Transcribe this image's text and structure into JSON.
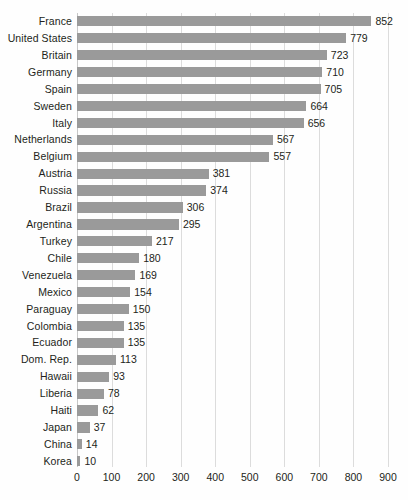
{
  "chart_data": {
    "type": "bar",
    "orientation": "horizontal",
    "title": "",
    "subtitle": "",
    "xlabel": "",
    "ylabel": "",
    "xlim": [
      0,
      900
    ],
    "xticks": [
      0,
      100,
      200,
      300,
      400,
      500,
      600,
      700,
      800,
      900
    ],
    "xtick_labels": [
      "0",
      "100",
      "200",
      "300",
      "400",
      "500",
      "600",
      "700",
      "800",
      "900"
    ],
    "grid": "vertical",
    "legend": "none",
    "bar_color": "#9a9a9a",
    "gridline_color": "#dcdcdc",
    "text_color": "#231f20",
    "background_color": "#fefefe",
    "data_labels": true,
    "categories": [
      "France",
      "United States",
      "Britain",
      "Germany",
      "Spain",
      "Sweden",
      "Italy",
      "Netherlands",
      "Belgium",
      "Austria",
      "Russia",
      "Brazil",
      "Argentina",
      "Turkey",
      "Chile",
      "Venezuela",
      "Mexico",
      "Paraguay",
      "Colombia",
      "Ecuador",
      "Dom. Rep.",
      "Hawaii",
      "Liberia",
      "Haiti",
      "Japan",
      "China",
      "Korea"
    ],
    "values": [
      852,
      779,
      723,
      710,
      705,
      664,
      656,
      567,
      557,
      381,
      374,
      306,
      295,
      217,
      180,
      169,
      154,
      150,
      135,
      135,
      113,
      93,
      78,
      62,
      37,
      14,
      10
    ],
    "value_labels": [
      "852",
      "779",
      "723",
      "710",
      "705",
      "664",
      "656",
      "567",
      "557",
      "381",
      "374",
      "306",
      "295",
      "217",
      "180",
      "169",
      "154",
      "150",
      "135",
      "135",
      "113",
      "93",
      "78",
      "62",
      "37",
      "14",
      "10"
    ]
  }
}
